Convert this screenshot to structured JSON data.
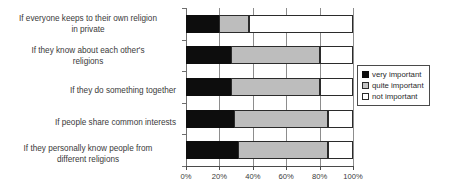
{
  "chart_data": {
    "type": "bar",
    "orientation": "horizontal",
    "stacked": true,
    "title": "",
    "xlabel": "",
    "ylabel": "",
    "xlim": [
      0,
      100
    ],
    "xticks": [
      "0%",
      "20%",
      "40%",
      "60%",
      "80%",
      "100%"
    ],
    "xtick_values": [
      0,
      20,
      40,
      60,
      80,
      100
    ],
    "grid": true,
    "legend_position": "right",
    "categories": [
      "If everyone keeps to their own religion in private",
      "If they know about each other's religions",
      "If they do something together",
      "If people share common interests",
      "If they personally know people from different religions"
    ],
    "category_lines": [
      [
        "If everyone keeps to their own religion",
        "in private"
      ],
      [
        "If they know about each other's",
        "religions"
      ],
      [
        "If they do something together"
      ],
      [
        "If people share common interests"
      ],
      [
        "If they personally know people from",
        "different religions"
      ]
    ],
    "series": [
      {
        "name": "very important",
        "color": "#0d0d0d",
        "values": [
          20,
          27,
          27,
          29,
          31
        ]
      },
      {
        "name": "quite important",
        "color": "#bdbdbd",
        "values": [
          18,
          53,
          53,
          56,
          54
        ]
      },
      {
        "name": "not important",
        "color": "#ffffff",
        "values": [
          62,
          20,
          20,
          15,
          15
        ]
      }
    ]
  },
  "legend": {
    "items": [
      {
        "label": "very important",
        "swatch": "very"
      },
      {
        "label": "quite important",
        "swatch": "quite"
      },
      {
        "label": "not important",
        "swatch": "not"
      }
    ]
  }
}
